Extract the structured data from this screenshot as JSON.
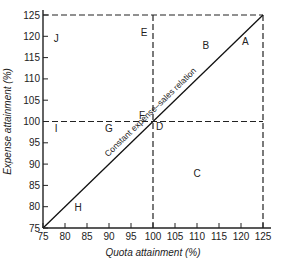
{
  "chart_data": {
    "type": "line",
    "title": "",
    "xlabel": "Quota attainment (%)",
    "ylabel": "Expense attainment (%)",
    "xlim": [
      75,
      125
    ],
    "ylim": [
      75,
      125
    ],
    "x_ticks": [
      75,
      80,
      85,
      90,
      95,
      100,
      105,
      110,
      115,
      120,
      125
    ],
    "y_ticks": [
      75,
      80,
      85,
      90,
      95,
      100,
      105,
      110,
      115,
      120,
      125
    ],
    "grid": false,
    "series": [
      {
        "name": "Constant expense-sales relation",
        "style": "solid",
        "points": [
          [
            75,
            75
          ],
          [
            125,
            125
          ]
        ]
      }
    ],
    "reference_lines": [
      {
        "orientation": "vertical",
        "x": 100,
        "style": "dashed"
      },
      {
        "orientation": "vertical",
        "x": 125,
        "style": "dashed"
      },
      {
        "orientation": "horizontal",
        "y": 100,
        "style": "dashed"
      },
      {
        "orientation": "horizontal",
        "y": 125,
        "style": "dashed"
      }
    ],
    "annotations": [
      {
        "text": "Constant expense–sales relation",
        "along": "diagonal"
      },
      {
        "text": "A",
        "x": 121,
        "y": 119
      },
      {
        "text": "B",
        "x": 112,
        "y": 118
      },
      {
        "text": "C",
        "x": 110,
        "y": 88
      },
      {
        "text": "D",
        "x": 101.5,
        "y": 99
      },
      {
        "text": "E",
        "x": 98,
        "y": 121
      },
      {
        "text": "F",
        "x": 97.5,
        "y": 101.5
      },
      {
        "text": "G",
        "x": 90,
        "y": 98.5
      },
      {
        "text": "H",
        "x": 83,
        "y": 80
      },
      {
        "text": "I",
        "x": 78,
        "y": 98.5
      },
      {
        "text": "J",
        "x": 78,
        "y": 119.5
      }
    ]
  }
}
